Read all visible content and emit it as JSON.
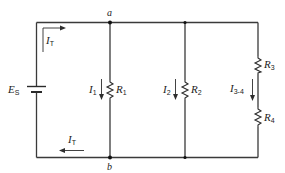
{
  "diagram": {
    "type": "series-parallel circuit",
    "nodes": {
      "top": "a",
      "bottom": "b"
    },
    "source": {
      "label": "E",
      "subscript": "S"
    },
    "total_current_top": {
      "label": "I",
      "subscript": "T"
    },
    "total_current_bottom": {
      "label": "I",
      "subscript": "T"
    },
    "branches": [
      {
        "resistors": [
          {
            "label": "R",
            "subscript": "1"
          }
        ],
        "current": {
          "label": "I",
          "subscript": "1"
        }
      },
      {
        "resistors": [
          {
            "label": "R",
            "subscript": "2"
          }
        ],
        "current": {
          "label": "I",
          "subscript": "2"
        }
      },
      {
        "resistors": [
          {
            "label": "R",
            "subscript": "3"
          },
          {
            "label": "R",
            "subscript": "4"
          }
        ],
        "current": {
          "label": "I",
          "subscript": "3-4"
        }
      }
    ]
  }
}
